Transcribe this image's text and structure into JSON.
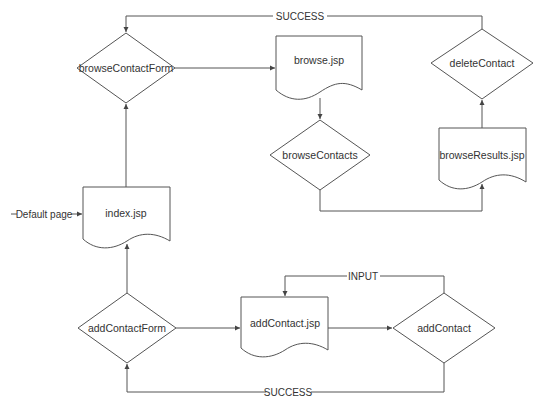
{
  "diagram": {
    "type": "flowchart",
    "colors": {
      "stroke": "#555555",
      "text": "#333333",
      "background": "#ffffff"
    },
    "nodes": {
      "browseContactForm": {
        "label": "browseContactForm",
        "shape": "diamond"
      },
      "browse_jsp": {
        "label": "browse.jsp",
        "shape": "document"
      },
      "browseContacts": {
        "label": "browseContacts",
        "shape": "diamond"
      },
      "deleteContact": {
        "label": "deleteContact",
        "shape": "diamond"
      },
      "browseResults_jsp": {
        "label": "browseResults.jsp",
        "shape": "document"
      },
      "index_jsp": {
        "label": "index.jsp",
        "shape": "document"
      },
      "addContactForm": {
        "label": "addContactForm",
        "shape": "diamond"
      },
      "addContact_jsp": {
        "label": "addContact.jsp",
        "shape": "document"
      },
      "addContact": {
        "label": "addContact",
        "shape": "diamond"
      }
    },
    "edges": {
      "default_page": {
        "label": "Default page",
        "from": "",
        "to": "index.jsp"
      },
      "success_top": {
        "label": "SUCCESS",
        "from": "deleteContact",
        "to": "browseContactForm"
      },
      "input": {
        "label": "INPUT",
        "from": "addContact",
        "to": "addContact.jsp"
      },
      "success_bottom": {
        "label": "SUCCESS",
        "from": "addContact",
        "to": "addContactForm"
      }
    }
  }
}
